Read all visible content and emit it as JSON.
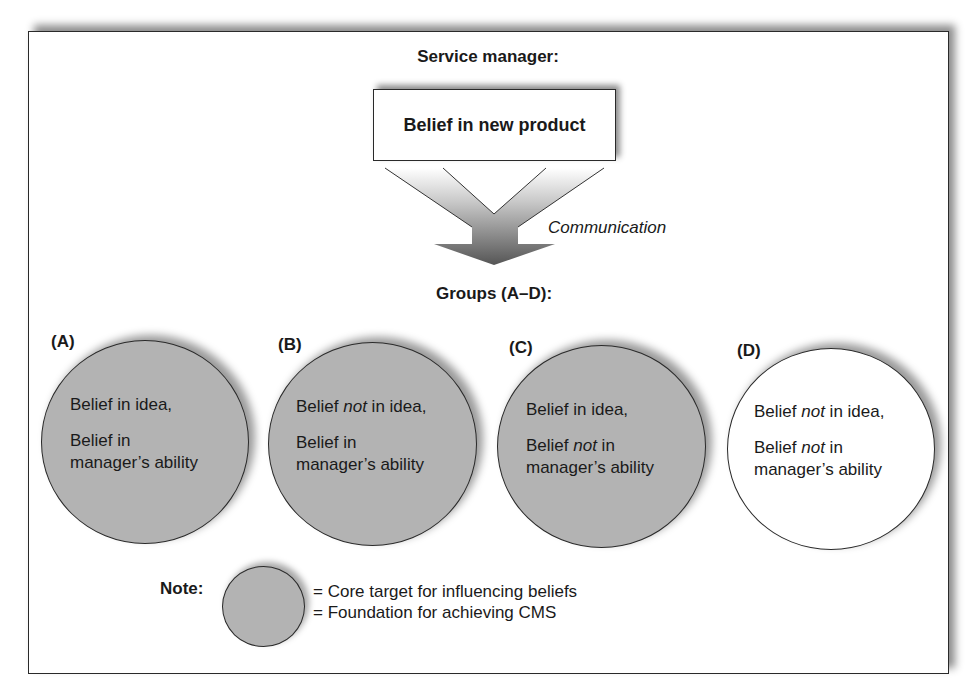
{
  "diagram": {
    "header": "Service manager:",
    "product_box": "Belief in new product",
    "arrow_label": "Communication",
    "groups_title": "Groups (A–D):",
    "groups": [
      {
        "label": "(A)",
        "type": "core",
        "line1_a": "Belief ",
        "line1_em": "",
        "line1_b": "in idea,",
        "line2_a": "Belief ",
        "line2_em": "",
        "line2_b": "in",
        "line3": "manager’s ability"
      },
      {
        "label": "(B)",
        "type": "core",
        "line1_a": "Belief ",
        "line1_em": "not",
        "line1_b": " in idea,",
        "line2_a": "Belief ",
        "line2_em": "",
        "line2_b": "in",
        "line3": "manager’s ability"
      },
      {
        "label": "(C)",
        "type": "core",
        "line1_a": "Belief ",
        "line1_em": "",
        "line1_b": "in idea,",
        "line2_a": "Belief ",
        "line2_em": "not",
        "line2_b": " in",
        "line3": "manager’s ability"
      },
      {
        "label": "(D)",
        "type": "other",
        "line1_a": "Belief ",
        "line1_em": "not",
        "line1_b": " in idea,",
        "line2_a": "Belief ",
        "line2_em": "not",
        "line2_b": " in",
        "line3": "manager’s ability"
      }
    ],
    "note": {
      "label": "Note:",
      "line1": "= Core target for influencing beliefs",
      "line2": "= Foundation for achieving CMS"
    },
    "colors": {
      "core_fill": "#b3b3b3",
      "other_fill": "#ffffff",
      "stroke": "#2a2a2a"
    }
  }
}
